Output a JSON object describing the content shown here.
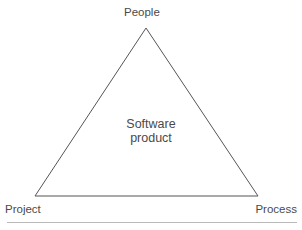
{
  "diagram": {
    "background_color": "#ffffff",
    "stroke_color": "#555555",
    "text_color": "#4a4a4a",
    "rule_color": "#b9b9b9",
    "vertices": {
      "apex": {
        "x": 146,
        "y": 28
      },
      "bottom_left": {
        "x": 35,
        "y": 196
      },
      "bottom_right": {
        "x": 258,
        "y": 196
      }
    },
    "labels": {
      "top": "People",
      "bottom_left": "Project",
      "bottom_right": "Process",
      "center_line1": "Software",
      "center_line2": "product"
    }
  }
}
